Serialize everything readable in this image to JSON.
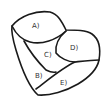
{
  "diagram": {
    "type": "region-map",
    "regions": [
      {
        "id": "A",
        "label": "A)"
      },
      {
        "id": "B",
        "label": "B)"
      },
      {
        "id": "C",
        "label": "C)"
      },
      {
        "id": "D",
        "label": "D)"
      },
      {
        "id": "E",
        "label": "E)"
      }
    ],
    "colors": {
      "stroke": "#1a1a1a",
      "label": "#333333",
      "background": "#ffffff"
    }
  }
}
